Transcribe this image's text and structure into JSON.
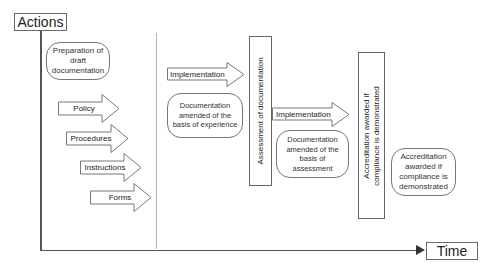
{
  "axes": {
    "y_label": "Actions",
    "x_label": "Time"
  },
  "phase1": {
    "preparation": "Preparation of draft documentation",
    "arrows": [
      {
        "label": "Policy"
      },
      {
        "label": "Procedures"
      },
      {
        "label": "Instructions"
      },
      {
        "label": "Forms"
      }
    ]
  },
  "phase2": {
    "implementation_label": "Implementation",
    "documentation_note": "Documentation amended of the basis of experience",
    "assessment_label": "Assessment of documentation"
  },
  "phase3": {
    "implementation_label": "Implementation",
    "documentation_note": "Documentation amended of the basis of assessment",
    "accreditation_bar_line1": "Accreditation awarded if",
    "accreditation_bar_line2": "compliance is demonstrated"
  },
  "outcome": {
    "accreditation_note": "Accreditation awarded if compliance is demonstrated"
  },
  "colors": {
    "line": "#555555",
    "border": "#6a6a6a",
    "separator": "#b5b5b5"
  }
}
